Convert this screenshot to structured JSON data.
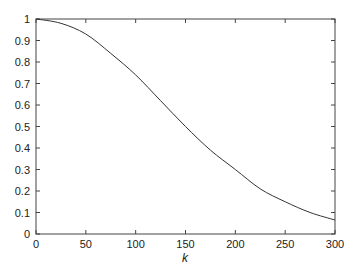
{
  "chart_data": {
    "type": "line",
    "title": "",
    "xlabel": "k",
    "ylabel": "",
    "xlim": [
      0,
      300
    ],
    "ylim": [
      0,
      1
    ],
    "grid": false,
    "legend": null,
    "x_ticks": [
      "0",
      "50",
      "100",
      "150",
      "200",
      "250",
      "300"
    ],
    "y_ticks": [
      "0",
      "0.1",
      "0.2",
      "0.3",
      "0.4",
      "0.5",
      "0.6",
      "0.7",
      "0.8",
      "0.9",
      "1"
    ],
    "series": [
      {
        "name": "curve",
        "color": "#333333",
        "x": [
          0,
          25,
          50,
          75,
          100,
          125,
          150,
          175,
          200,
          225,
          250,
          275,
          300
        ],
        "y": [
          1.0,
          0.98,
          0.93,
          0.84,
          0.74,
          0.62,
          0.5,
          0.39,
          0.3,
          0.21,
          0.15,
          0.1,
          0.065
        ]
      }
    ]
  }
}
